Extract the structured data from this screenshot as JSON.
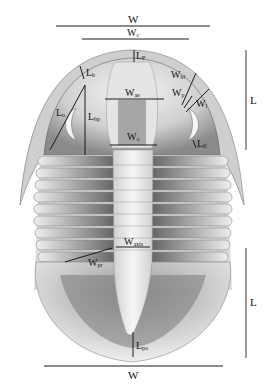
{
  "figure": {
    "colors": {
      "line": "#1a1a1a",
      "scale_bar": "#555555",
      "shell_light": "#e9e9e9",
      "shell_mid": "#b9b9b9",
      "shell_dark": "#5a5a5a"
    }
  },
  "labels": {
    "W_top": {
      "main": "W",
      "sub": ""
    },
    "Wc": {
      "main": "W",
      "sub": "c"
    },
    "Lp": {
      "main": "L",
      "sub": "P"
    },
    "Lb": {
      "main": "L",
      "sub": "b"
    },
    "Wbl": {
      "main": "W",
      "sub": "bl"
    },
    "Wae": {
      "main": "W",
      "sub": "ae"
    },
    "Wp": {
      "main": "W",
      "sub": "p"
    },
    "Wl": {
      "main": "W",
      "sub": "l"
    },
    "Lo": {
      "main": "L",
      "sub": "o"
    },
    "Lbp": {
      "main": "L",
      "sub": "bp"
    },
    "Wo": {
      "main": "W",
      "sub": "o"
    },
    "Lfl": {
      "main": "L",
      "sub": "fl"
    },
    "Waxis": {
      "main": "W",
      "sub": "axis"
    },
    "Wpr": {
      "main": "W",
      "sub": "pr"
    },
    "Lpo": {
      "main": "L",
      "sub": "po"
    },
    "W_bottom": {
      "main": "W",
      "sub": ""
    },
    "L_cephalon": {
      "main": "L",
      "sub": ""
    },
    "L_pygidium": {
      "main": "L",
      "sub": ""
    }
  }
}
